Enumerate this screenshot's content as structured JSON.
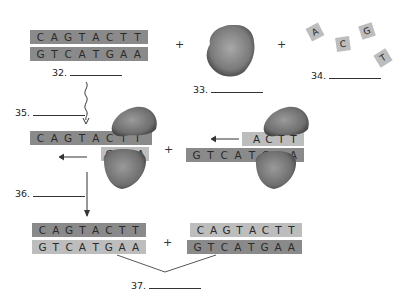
{
  "diagram": {
    "title_hidden": "",
    "top": {
      "parent_dna": {
        "top_strand": [
          "C",
          "A",
          "G",
          "T",
          "A",
          "C",
          "T",
          "T"
        ],
        "bottom_strand": [
          "G",
          "T",
          "C",
          "A",
          "T",
          "G",
          "A",
          "A"
        ],
        "label": "32."
      },
      "plus_1": "+",
      "enzyme": {
        "label": "33."
      },
      "plus_2": "+",
      "nucleotides": {
        "tiles": [
          "A",
          "C",
          "G",
          "T"
        ],
        "label": "34."
      }
    },
    "middle": {
      "label_35": "35.",
      "label_36": "36.",
      "left_complex": {
        "template_strand": [
          "C",
          "A",
          "G",
          "T",
          "A",
          "C",
          "T",
          "T"
        ],
        "new_strand": [
          "G",
          "A",
          "A"
        ]
      },
      "plus": "+",
      "right_complex": {
        "new_strand": [
          "A",
          "C",
          "T",
          "T"
        ],
        "template_strand": [
          "G",
          "T",
          "C",
          "A",
          "T",
          "G",
          "A",
          "A"
        ]
      }
    },
    "bottom": {
      "dna_1": {
        "top_strand": [
          "C",
          "A",
          "G",
          "T",
          "A",
          "C",
          "T",
          "T"
        ],
        "bottom_strand": [
          "G",
          "T",
          "C",
          "A",
          "T",
          "G",
          "A",
          "A"
        ]
      },
      "plus": "+",
      "dna_2": {
        "top_strand": [
          "C",
          "A",
          "G",
          "T",
          "A",
          "C",
          "T",
          "T"
        ],
        "bottom_strand": [
          "G",
          "T",
          "C",
          "A",
          "T",
          "G",
          "A",
          "A"
        ]
      },
      "label_37": "37."
    },
    "colors": {
      "dark_strand": "#8a8a8a",
      "light_strand": "#bdbdbd",
      "enzyme": "#6f6f6f"
    }
  }
}
